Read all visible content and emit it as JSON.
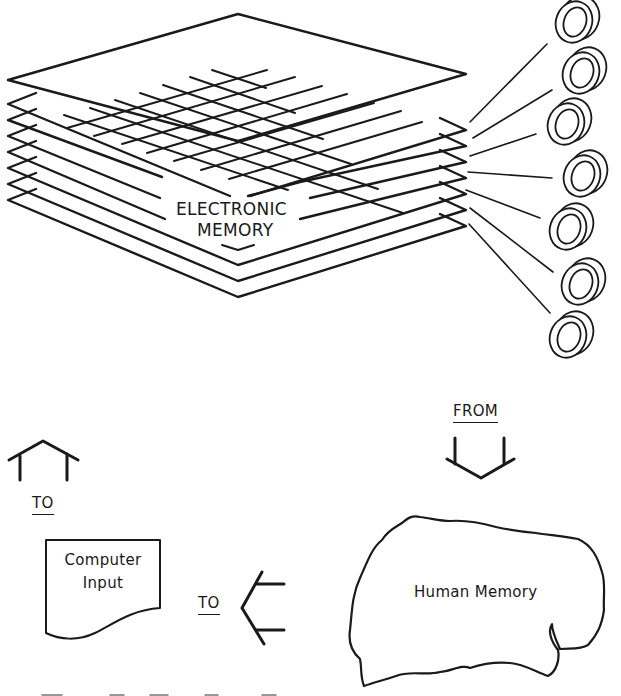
{
  "diagram": {
    "electronic_memory": {
      "label_line1": "ELECTRONIC",
      "label_line2": "MEMORY",
      "plate_count": 8,
      "core_count": 7
    },
    "computer_input": {
      "label_line1": "Computer",
      "label_line2": "Input"
    },
    "human_memory": {
      "label": "Human Memory"
    },
    "arrows": [
      {
        "id": "up-arrow",
        "label": "TO",
        "direction": "up"
      },
      {
        "id": "left-arrow",
        "label": "TO",
        "direction": "left"
      },
      {
        "id": "down-arrow",
        "label": "FROM",
        "direction": "down"
      }
    ],
    "stroke_color": "#1a1a1a",
    "background_color": "#ffffff"
  }
}
